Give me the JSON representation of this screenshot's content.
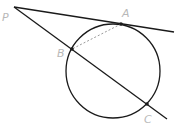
{
  "diagram": {
    "type": "geometry-tangent-secant",
    "colors": {
      "line": "#1a1a1a",
      "label": "#b8b8b8",
      "dashed": "#9a9a9a"
    },
    "circle": {
      "cx": 113,
      "cy": 71,
      "r": 47
    },
    "points": {
      "P": {
        "label": "P",
        "x": 14,
        "y": 7,
        "lx": 2,
        "ly": 21
      },
      "A": {
        "label": "A",
        "x": 121,
        "y": 24,
        "lx": 122,
        "ly": 17
      },
      "B": {
        "label": "B",
        "x": 72,
        "y": 49,
        "lx": 57,
        "ly": 57
      },
      "C": {
        "label": "C",
        "x": 147,
        "y": 104,
        "lx": 144,
        "ly": 123
      }
    },
    "tangent_line": {
      "x1": 14,
      "y1": 7,
      "x2": 174,
      "y2": 32
    },
    "secant_line": {
      "x1": 14,
      "y1": 7,
      "x2": 167,
      "y2": 119
    },
    "chord_AB": {
      "style": "dashed"
    }
  }
}
